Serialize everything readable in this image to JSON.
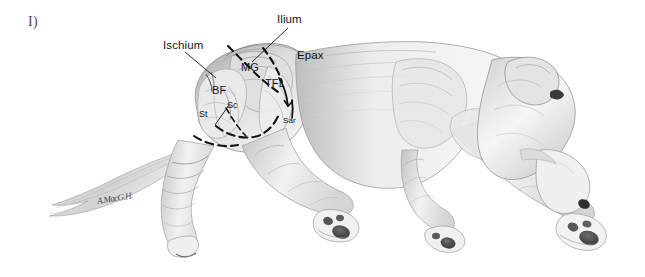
{
  "figure": {
    "panel_label": "I)",
    "signature": "A.MacG.H."
  },
  "palette": {
    "background": "#ffffff",
    "ink": "#141414",
    "panel_label": "#4a4a4a",
    "body_light": "#f2f2f2",
    "body_mid": "#cfcfcf",
    "body_shadow": "#9a9a9a",
    "body_dark": "#6b6b6b",
    "paw_pad": "#4a4a4a",
    "dashed_line": "#111111"
  },
  "annotations": {
    "external": [
      {
        "id": "ischium",
        "label": "Ischium",
        "x": 163,
        "y": 40,
        "leader": true
      },
      {
        "id": "ilium",
        "label": "Ilium",
        "x": 277,
        "y": 14,
        "leader": true
      },
      {
        "id": "epax",
        "label": "Epax",
        "x": 297,
        "y": 50,
        "leader": false
      }
    ],
    "internal": [
      {
        "id": "mg",
        "label": "MG",
        "x": 241,
        "y": 62,
        "size": "inside"
      },
      {
        "id": "tfl",
        "label": "TFL",
        "x": 265,
        "y": 78,
        "size": "inside"
      },
      {
        "id": "bf",
        "label": "BF",
        "x": 212,
        "y": 85,
        "size": "inside"
      },
      {
        "id": "st",
        "label": "St",
        "x": 199,
        "y": 110,
        "size": "mid"
      },
      {
        "id": "sc",
        "label": "Sc",
        "x": 227,
        "y": 101,
        "size": "mid"
      },
      {
        "id": "sar",
        "label": "Sar",
        "x": 283,
        "y": 117,
        "size": "small"
      }
    ]
  },
  "legend_terms": {
    "Ilium": "ilium (pelvic bone landmark)",
    "Ischium": "ischium (pelvic bone landmark)",
    "Epax": "epaxial musculature",
    "MG": "middle gluteal",
    "TFL": "tensor fasciae latae",
    "BF": "biceps femoris",
    "St": "semitendinosus",
    "Sc": "sacrocaudalis",
    "Sar": "sartorius"
  }
}
